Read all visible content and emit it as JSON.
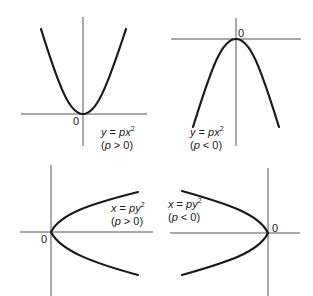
{
  "figure": {
    "panels": [
      {
        "id": "top-left",
        "equation": {
          "var": "y",
          "eq": " = ",
          "coef": "p",
          "arg": "x",
          "exp": "2"
        },
        "condition": {
          "open": "(",
          "param": "p",
          "rel": " > ",
          "val": "0",
          "close": ")"
        },
        "origin_label": "0",
        "opens": "up"
      },
      {
        "id": "top-right",
        "equation": {
          "var": "y",
          "eq": " = ",
          "coef": "p",
          "arg": "x",
          "exp": "2"
        },
        "condition": {
          "open": "(",
          "param": "p",
          "rel": " < ",
          "val": "0",
          "close": ")"
        },
        "origin_label": "0",
        "opens": "down"
      },
      {
        "id": "bottom-left",
        "equation": {
          "var": "x",
          "eq": " = ",
          "coef": "p",
          "arg": "y",
          "exp": "2"
        },
        "condition": {
          "open": "(",
          "param": "p",
          "rel": " > ",
          "val": "0",
          "close": ")"
        },
        "origin_label": "0",
        "opens": "right"
      },
      {
        "id": "bottom-right",
        "equation": {
          "var": "x",
          "eq": " = ",
          "coef": "p",
          "arg": "y",
          "exp": "2"
        },
        "condition": {
          "open": "(",
          "param": "p",
          "rel": " < ",
          "val": "0",
          "close": ")"
        },
        "origin_label": "0",
        "opens": "left"
      }
    ],
    "colors": {
      "axis": "#555555",
      "curve": "#1a1a1a",
      "text": "#222222",
      "background": "#ffffff"
    }
  }
}
